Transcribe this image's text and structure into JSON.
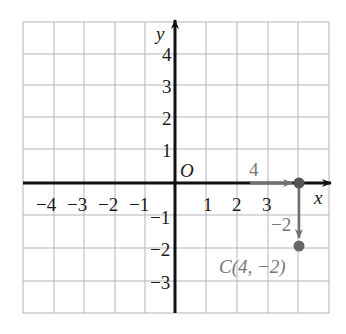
{
  "figure": {
    "part_label": "b)",
    "grid": {
      "x_min": -5,
      "x_max": 5,
      "y_min": -4,
      "y_max": 5,
      "line_color": "#b5b5b5"
    },
    "axes": {
      "x_label": "x",
      "y_label": "y",
      "origin_label": "O",
      "x_ticks_negative": [
        "−4",
        "−3",
        "−2",
        "−1"
      ],
      "x_ticks_positive": [
        "1",
        "2",
        "3"
      ],
      "y_ticks_positive": [
        "1",
        "2",
        "3",
        "4"
      ],
      "y_ticks_negative": [
        "−1",
        "−2",
        "−3"
      ],
      "axis_color": "#111111"
    },
    "translation": {
      "horizontal_label": "4",
      "vertical_label": "−2",
      "arrow_color": "#707070"
    },
    "point": {
      "label": "C(4, −2)",
      "x": 4,
      "y": -2,
      "color": "#666666"
    }
  }
}
